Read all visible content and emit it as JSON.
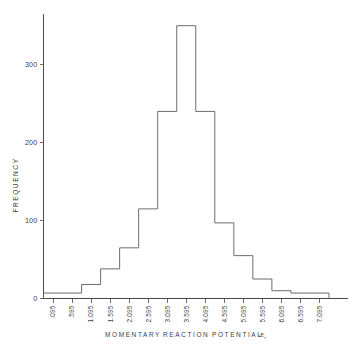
{
  "chart_data": {
    "type": "bar",
    "title": "",
    "subtitle": "",
    "xlabel": "MOMENTARY   REACTION   POTENTIAL",
    "xlabel_words": [
      "MOMENTARY",
      "REACTION",
      "POTENTIAL"
    ],
    "xlabel_unit": "sEr",
    "ylabel": "FREQUENCY",
    "categories": [
      ".095",
      ".595",
      "1.095",
      "1.595",
      "2.095",
      "2.595",
      "3.095",
      "3.595",
      "4.095",
      "4.595",
      "5.095",
      "5.595",
      "6.095",
      "6.595",
      "7.095"
    ],
    "bin_edges": [
      0.095,
      0.595,
      1.095,
      1.595,
      2.095,
      2.595,
      3.095,
      3.595,
      4.095,
      4.595,
      5.095,
      5.595,
      6.095,
      6.595,
      7.095,
      7.595
    ],
    "values": [
      7,
      7,
      18,
      38,
      65,
      115,
      240,
      350,
      240,
      97,
      55,
      25,
      10,
      7,
      7
    ],
    "ylim": [
      0,
      365
    ],
    "xlim": [
      0.095,
      7.595
    ],
    "ytick_values": [
      0,
      100,
      200,
      300
    ],
    "ytick_labels": [
      "0",
      "100",
      "200",
      "300"
    ],
    "grid": false,
    "legend": false,
    "style": "outline-step-histogram",
    "line_color": "#5c5c5c",
    "axis_color": "#4a4a4a"
  },
  "figure": {
    "background": "#ffffff"
  }
}
